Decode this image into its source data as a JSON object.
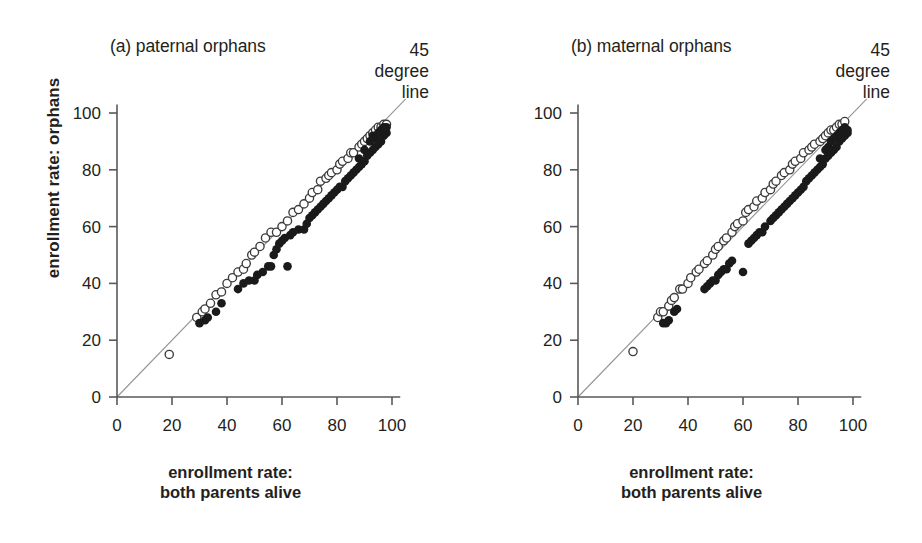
{
  "figure": {
    "background": "#ffffff",
    "axis_color": "#58595b",
    "line_color": "#939598",
    "filled_marker_color": "#1a1a1a",
    "open_marker_fill": "#ffffff",
    "open_marker_stroke": "#3b3b3b"
  },
  "shared": {
    "xlabel_line1": "enrollment rate:",
    "xlabel_line2": "both parents alive",
    "ylabel": "enrollment rate: orphans",
    "annotation": "45\ndegree\nline",
    "xticks": [
      "0",
      "20",
      "40",
      "60",
      "80",
      "100"
    ],
    "yticks": [
      "0",
      "20",
      "40",
      "60",
      "80",
      "100"
    ]
  },
  "chart_data": [
    {
      "type": "scatter",
      "title": "(a) paternal orphans",
      "xlabel": "enrollment rate: both parents alive",
      "ylabel": "enrollment rate: orphans",
      "xlim": [
        0,
        108
      ],
      "ylim": [
        0,
        108
      ],
      "xticks": [
        0,
        20,
        40,
        60,
        80,
        100
      ],
      "yticks": [
        0,
        20,
        40,
        60,
        80,
        100
      ],
      "grid": false,
      "legend": "none",
      "annotations": [
        {
          "text": "45 degree line",
          "x": 104,
          "y": 112
        }
      ],
      "reference_line": {
        "name": "45 degree line",
        "from": [
          0,
          0
        ],
        "to": [
          105,
          105
        ]
      },
      "series": [
        {
          "name": "open-circle",
          "marker": "open",
          "points": [
            [
              19,
              15
            ],
            [
              29,
              28
            ],
            [
              31,
              30
            ],
            [
              32,
              31
            ],
            [
              34,
              33
            ],
            [
              36,
              36
            ],
            [
              38,
              37
            ],
            [
              40,
              40
            ],
            [
              42,
              42
            ],
            [
              44,
              44
            ],
            [
              46,
              45
            ],
            [
              47,
              47
            ],
            [
              49,
              50
            ],
            [
              50,
              51
            ],
            [
              52,
              53
            ],
            [
              54,
              56
            ],
            [
              56,
              58
            ],
            [
              58,
              58
            ],
            [
              60,
              60
            ],
            [
              62,
              62
            ],
            [
              64,
              65
            ],
            [
              66,
              66
            ],
            [
              68,
              68
            ],
            [
              70,
              70
            ],
            [
              71,
              72
            ],
            [
              73,
              73
            ],
            [
              74,
              76
            ],
            [
              76,
              77
            ],
            [
              77,
              78
            ],
            [
              78,
              79
            ],
            [
              80,
              80
            ],
            [
              81,
              82
            ],
            [
              82,
              83
            ],
            [
              84,
              84
            ],
            [
              85,
              86
            ],
            [
              86,
              86
            ],
            [
              88,
              88
            ],
            [
              89,
              89
            ],
            [
              90,
              90
            ],
            [
              91,
              91
            ],
            [
              92,
              92
            ],
            [
              93,
              93
            ],
            [
              94,
              94
            ],
            [
              95,
              95
            ],
            [
              96,
              95
            ],
            [
              97,
              96
            ],
            [
              98,
              96
            ]
          ]
        },
        {
          "name": "filled-circle",
          "marker": "filled",
          "points": [
            [
              30,
              26
            ],
            [
              32,
              27
            ],
            [
              33,
              28
            ],
            [
              36,
              30
            ],
            [
              38,
              33
            ],
            [
              44,
              38
            ],
            [
              46,
              40
            ],
            [
              48,
              41
            ],
            [
              50,
              41
            ],
            [
              51,
              43
            ],
            [
              53,
              44
            ],
            [
              55,
              46
            ],
            [
              56,
              46
            ],
            [
              62,
              46
            ],
            [
              57,
              50
            ],
            [
              58,
              52
            ],
            [
              59,
              54
            ],
            [
              60,
              55
            ],
            [
              61,
              56
            ],
            [
              63,
              57
            ],
            [
              64,
              58
            ],
            [
              66,
              59
            ],
            [
              68,
              59
            ],
            [
              69,
              61
            ],
            [
              70,
              63
            ],
            [
              71,
              64
            ],
            [
              72,
              65
            ],
            [
              73,
              66
            ],
            [
              74,
              67
            ],
            [
              75,
              68
            ],
            [
              76,
              69
            ],
            [
              77,
              70
            ],
            [
              78,
              71
            ],
            [
              79,
              72
            ],
            [
              80,
              73
            ],
            [
              81,
              74
            ],
            [
              82,
              74
            ],
            [
              83,
              76
            ],
            [
              84,
              77
            ],
            [
              85,
              78
            ],
            [
              86,
              79
            ],
            [
              87,
              80
            ],
            [
              88,
              81
            ],
            [
              88,
              84
            ],
            [
              89,
              82
            ],
            [
              90,
              83
            ],
            [
              90,
              87
            ],
            [
              91,
              85
            ],
            [
              92,
              86
            ],
            [
              92,
              90
            ],
            [
              93,
              87
            ],
            [
              93,
              92
            ],
            [
              94,
              88
            ],
            [
              94,
              91
            ],
            [
              95,
              89
            ],
            [
              95,
              93
            ],
            [
              96,
              90
            ],
            [
              96,
              94
            ],
            [
              97,
              92
            ],
            [
              97,
              95
            ],
            [
              98,
              93
            ],
            [
              98,
              95
            ]
          ]
        }
      ]
    },
    {
      "type": "scatter",
      "title": "(b) maternal orphans",
      "xlabel": "enrollment rate: both parents alive",
      "ylabel": "enrollment rate: orphans",
      "xlim": [
        0,
        108
      ],
      "ylim": [
        0,
        108
      ],
      "xticks": [
        0,
        20,
        40,
        60,
        80,
        100
      ],
      "yticks": [
        0,
        20,
        40,
        60,
        80,
        100
      ],
      "grid": false,
      "legend": "none",
      "annotations": [
        {
          "text": "45 degree line",
          "x": 104,
          "y": 112
        }
      ],
      "reference_line": {
        "name": "45 degree line",
        "from": [
          0,
          0
        ],
        "to": [
          105,
          105
        ]
      },
      "series": [
        {
          "name": "open-circle",
          "marker": "open",
          "points": [
            [
              20,
              16
            ],
            [
              29,
              28
            ],
            [
              30,
              30
            ],
            [
              31,
              30
            ],
            [
              33,
              32
            ],
            [
              34,
              34
            ],
            [
              35,
              35
            ],
            [
              37,
              38
            ],
            [
              38,
              38
            ],
            [
              40,
              40
            ],
            [
              41,
              42
            ],
            [
              43,
              44
            ],
            [
              44,
              45
            ],
            [
              46,
              47
            ],
            [
              47,
              48
            ],
            [
              49,
              50
            ],
            [
              50,
              52
            ],
            [
              51,
              53
            ],
            [
              53,
              55
            ],
            [
              54,
              56
            ],
            [
              56,
              58
            ],
            [
              57,
              60
            ],
            [
              58,
              61
            ],
            [
              60,
              62
            ],
            [
              61,
              65
            ],
            [
              62,
              66
            ],
            [
              64,
              67
            ],
            [
              65,
              69
            ],
            [
              67,
              70
            ],
            [
              68,
              72
            ],
            [
              70,
              73
            ],
            [
              71,
              75
            ],
            [
              72,
              76
            ],
            [
              74,
              78
            ],
            [
              75,
              79
            ],
            [
              77,
              80
            ],
            [
              78,
              82
            ],
            [
              79,
              83
            ],
            [
              81,
              84
            ],
            [
              82,
              86
            ],
            [
              84,
              87
            ],
            [
              85,
              88
            ],
            [
              86,
              89
            ],
            [
              88,
              90
            ],
            [
              89,
              91
            ],
            [
              90,
              92
            ],
            [
              91,
              93
            ],
            [
              92,
              94
            ],
            [
              93,
              94
            ],
            [
              94,
              95
            ],
            [
              95,
              96
            ],
            [
              96,
              96
            ],
            [
              97,
              97
            ]
          ]
        },
        {
          "name": "filled-circle",
          "marker": "filled",
          "points": [
            [
              31,
              26
            ],
            [
              32,
              26
            ],
            [
              33,
              27
            ],
            [
              35,
              30
            ],
            [
              36,
              31
            ],
            [
              46,
              38
            ],
            [
              47,
              39
            ],
            [
              48,
              40
            ],
            [
              49,
              41
            ],
            [
              50,
              41
            ],
            [
              51,
              43
            ],
            [
              52,
              44
            ],
            [
              53,
              45
            ],
            [
              54,
              45
            ],
            [
              55,
              47
            ],
            [
              56,
              48
            ],
            [
              60,
              44
            ],
            [
              62,
              54
            ],
            [
              63,
              55
            ],
            [
              64,
              56
            ],
            [
              65,
              57
            ],
            [
              66,
              58
            ],
            [
              67,
              58
            ],
            [
              68,
              60
            ],
            [
              70,
              62
            ],
            [
              71,
              63
            ],
            [
              72,
              64
            ],
            [
              73,
              65
            ],
            [
              74,
              66
            ],
            [
              75,
              67
            ],
            [
              76,
              68
            ],
            [
              77,
              69
            ],
            [
              78,
              70
            ],
            [
              79,
              71
            ],
            [
              80,
              72
            ],
            [
              81,
              73
            ],
            [
              82,
              74
            ],
            [
              83,
              76
            ],
            [
              84,
              77
            ],
            [
              85,
              78
            ],
            [
              86,
              79
            ],
            [
              87,
              80
            ],
            [
              88,
              81
            ],
            [
              88,
              84
            ],
            [
              89,
              82
            ],
            [
              90,
              84
            ],
            [
              90,
              87
            ],
            [
              91,
              85
            ],
            [
              91,
              88
            ],
            [
              92,
              86
            ],
            [
              92,
              90
            ],
            [
              93,
              87
            ],
            [
              93,
              91
            ],
            [
              94,
              88
            ],
            [
              94,
              92
            ],
            [
              95,
              90
            ],
            [
              95,
              93
            ],
            [
              96,
              91
            ],
            [
              96,
              94
            ],
            [
              97,
              92
            ],
            [
              97,
              95
            ],
            [
              98,
              93
            ],
            [
              98,
              94
            ]
          ]
        }
      ]
    }
  ]
}
